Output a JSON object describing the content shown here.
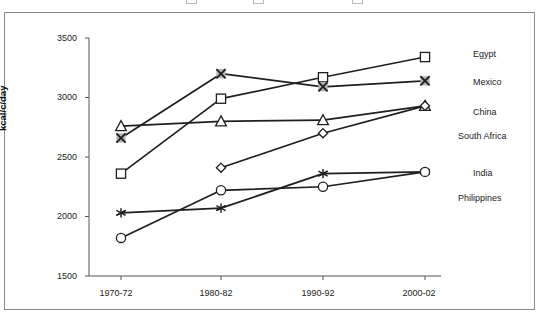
{
  "chart_data": {
    "type": "line",
    "title": "",
    "xlabel": "",
    "ylabel": "kcal/c/day",
    "categories": [
      "1970-72",
      "1980-82",
      "1990-92",
      "2000-02"
    ],
    "ylim": [
      1500,
      3500
    ],
    "yticks": [
      1500,
      2000,
      2500,
      3000,
      3500
    ],
    "grid": false,
    "legend_position": "right",
    "series": [
      {
        "name": "Egypt",
        "marker": "square",
        "values": [
          2360,
          2990,
          3170,
          3340
        ]
      },
      {
        "name": "Mexico",
        "marker": "cross-x",
        "values": [
          2660,
          3200,
          3090,
          3140
        ]
      },
      {
        "name": "China",
        "marker": "triangle",
        "values": [
          2760,
          2800,
          2810,
          2930
        ]
      },
      {
        "name": "South Africa",
        "marker": "diamond",
        "values": [
          null,
          2410,
          2700,
          2930
        ]
      },
      {
        "name": "India",
        "marker": "star",
        "values": [
          2030,
          2070,
          2360,
          2375
        ]
      },
      {
        "name": "Philippines",
        "marker": "circle",
        "values": [
          1820,
          2220,
          2250,
          2375
        ]
      }
    ]
  },
  "axis": {
    "y_title": "kcal/c/day",
    "y_tick_labels": [
      "3500",
      "3000",
      "2500",
      "2000",
      "1500"
    ],
    "x_tick_labels": [
      "1970-72",
      "1980-82",
      "1990-92",
      "2000-02"
    ]
  },
  "legend": {
    "items": [
      {
        "label": "Egypt"
      },
      {
        "label": "Mexico"
      },
      {
        "label": "China"
      },
      {
        "label": "South Africa"
      },
      {
        "label": "India"
      },
      {
        "label": "Philippines"
      }
    ]
  },
  "colors": {
    "line": "#1f1f1f",
    "marker_fill_light": "#ffffff",
    "marker_fill_shaded": "#b3b3b3",
    "axis": "#555555",
    "frame": "#8a8a8a",
    "text": "#222222"
  }
}
